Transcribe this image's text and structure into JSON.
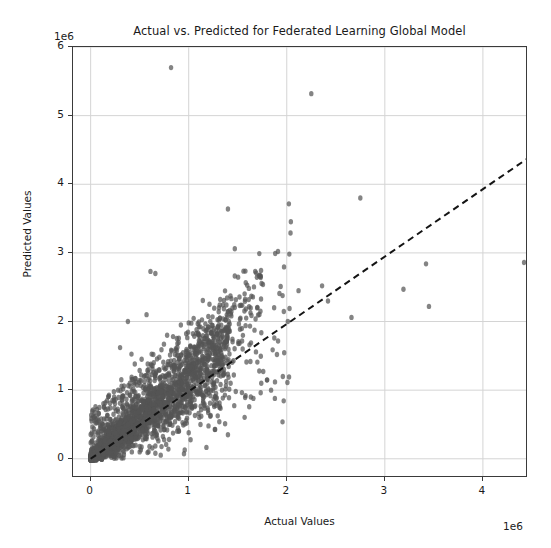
{
  "chart_data": {
    "type": "scatter",
    "title": "Actual vs. Predicted for Federated Learning Global Model",
    "xlabel": "Actual Values",
    "ylabel": "Predicted Values",
    "x_offset_text": "1e6",
    "y_offset_text": "1e6",
    "xlim": [
      -0.18,
      4.46
    ],
    "ylim": [
      -0.28,
      6.0
    ],
    "xticks": [
      0,
      1,
      2,
      3,
      4
    ],
    "xtick_labels": [
      "0",
      "1",
      "2",
      "3",
      "4"
    ],
    "yticks": [
      0,
      1,
      2,
      3,
      4,
      5,
      6
    ],
    "ytick_labels": [
      "0",
      "1",
      "2",
      "3",
      "4",
      "5",
      "6"
    ],
    "grid": true,
    "grid_color": "#d4d4d4",
    "legend": "none",
    "marker_color": "#555555",
    "marker_opacity": 0.72,
    "marker_size": 5.4,
    "reference_line": {
      "name": "identity-fit-line",
      "style": "dashed",
      "color": "#141414",
      "width": 2.0,
      "x_start": 0.0,
      "y_start": 0.0,
      "x_end": 4.46,
      "y_end": 4.38
    },
    "series": [
      {
        "name": "predictions",
        "points": [
          [
            0.82,
            5.7
          ],
          [
            2.25,
            5.32
          ],
          [
            1.4,
            3.64
          ],
          [
            2.75,
            3.8
          ],
          [
            1.47,
            3.06
          ],
          [
            1.72,
            2.99
          ],
          [
            0.61,
            2.73
          ],
          [
            0.66,
            2.7
          ],
          [
            0.38,
            2.0
          ],
          [
            0.57,
            2.1
          ],
          [
            2.12,
            2.45
          ],
          [
            2.36,
            2.52
          ],
          [
            3.42,
            2.84
          ],
          [
            4.42,
            2.86
          ],
          [
            3.19,
            2.47
          ],
          [
            3.45,
            2.22
          ],
          [
            2.42,
            2.3
          ],
          [
            2.66,
            2.06
          ],
          [
            1.22,
            2.0
          ],
          [
            1.0,
            1.98
          ],
          [
            0.92,
            1.95
          ],
          [
            1.08,
            1.88
          ],
          [
            0.78,
            1.8
          ],
          [
            1.3,
            1.72
          ],
          [
            1.62,
            1.66
          ],
          [
            1.55,
            1.6
          ],
          [
            1.18,
            1.55
          ],
          [
            0.86,
            1.52
          ],
          [
            0.7,
            1.48
          ],
          [
            0.52,
            1.45
          ],
          [
            0.45,
            1.38
          ],
          [
            0.62,
            1.36
          ],
          [
            1.02,
            1.34
          ],
          [
            1.36,
            1.3
          ],
          [
            1.72,
            1.28
          ],
          [
            1.46,
            1.22
          ],
          [
            1.8,
            1.15
          ],
          [
            1.88,
            1.12
          ],
          [
            1.4,
            0.35
          ],
          [
            0.96,
            1.26
          ],
          [
            0.8,
            1.22
          ],
          [
            0.66,
            1.18
          ],
          [
            0.5,
            1.14
          ],
          [
            0.4,
            1.1
          ],
          [
            0.34,
            1.06
          ],
          [
            0.28,
            1.0
          ],
          [
            0.44,
            0.98
          ],
          [
            0.58,
            0.96
          ],
          [
            0.72,
            0.98
          ],
          [
            0.88,
            1.02
          ],
          [
            1.04,
            1.04
          ],
          [
            1.2,
            1.02
          ],
          [
            1.34,
            1.0
          ],
          [
            1.48,
            0.98
          ],
          [
            1.58,
            0.92
          ],
          [
            1.66,
            0.88
          ],
          [
            0.24,
            0.9
          ],
          [
            0.32,
            0.86
          ],
          [
            0.42,
            0.84
          ],
          [
            0.54,
            0.82
          ],
          [
            0.64,
            0.8
          ],
          [
            0.76,
            0.82
          ],
          [
            0.9,
            0.84
          ],
          [
            1.06,
            0.86
          ],
          [
            1.16,
            0.8
          ],
          [
            1.26,
            0.76
          ],
          [
            0.2,
            0.74
          ],
          [
            0.26,
            0.7
          ],
          [
            0.36,
            0.68
          ],
          [
            0.46,
            0.66
          ],
          [
            0.56,
            0.64
          ],
          [
            0.68,
            0.66
          ],
          [
            0.82,
            0.68
          ],
          [
            0.94,
            0.7
          ],
          [
            1.1,
            0.66
          ],
          [
            1.22,
            0.62
          ],
          [
            0.16,
            0.58
          ],
          [
            0.22,
            0.54
          ],
          [
            0.3,
            0.52
          ],
          [
            0.38,
            0.5
          ],
          [
            0.48,
            0.5
          ],
          [
            0.6,
            0.52
          ],
          [
            0.74,
            0.54
          ],
          [
            0.86,
            0.54
          ],
          [
            0.98,
            0.52
          ],
          [
            1.12,
            0.5
          ],
          [
            0.12,
            0.42
          ],
          [
            0.18,
            0.4
          ],
          [
            0.25,
            0.38
          ],
          [
            0.33,
            0.38
          ],
          [
            0.43,
            0.4
          ],
          [
            0.53,
            0.42
          ],
          [
            0.65,
            0.42
          ],
          [
            0.78,
            0.42
          ],
          [
            0.9,
            0.4
          ],
          [
            1.0,
            0.38
          ],
          [
            0.08,
            0.28
          ],
          [
            0.14,
            0.26
          ],
          [
            0.2,
            0.26
          ],
          [
            0.28,
            0.28
          ],
          [
            0.36,
            0.3
          ],
          [
            0.46,
            0.3
          ],
          [
            0.56,
            0.3
          ],
          [
            0.68,
            0.3
          ],
          [
            0.8,
            0.28
          ],
          [
            0.06,
            0.16
          ],
          [
            0.1,
            0.14
          ],
          [
            0.16,
            0.14
          ],
          [
            0.24,
            0.16
          ],
          [
            0.32,
            0.18
          ],
          [
            0.4,
            0.18
          ],
          [
            0.5,
            0.18
          ],
          [
            0.6,
            0.18
          ],
          [
            0.04,
            0.06
          ],
          [
            0.08,
            0.06
          ],
          [
            0.13,
            0.07
          ],
          [
            0.19,
            0.08
          ],
          [
            0.26,
            0.09
          ],
          [
            0.34,
            0.1
          ],
          [
            0.42,
            0.1
          ],
          [
            0.5,
            0.1
          ],
          [
            0.58,
            0.09
          ],
          [
            0.66,
            0.08
          ],
          [
            1.9,
            1.52
          ],
          [
            1.96,
            1.2
          ],
          [
            1.74,
            1.1
          ],
          [
            1.84,
            1.0
          ],
          [
            0.3,
            1.62
          ]
        ]
      }
    ],
    "cluster_note": "dense elongated cloud along identity line from origin to ~1.3e6"
  }
}
